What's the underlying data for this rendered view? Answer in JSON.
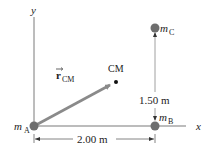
{
  "diagram": {
    "axes": {
      "x_label": "x",
      "y_label": "y"
    },
    "masses": [
      {
        "id": "A",
        "label": "m",
        "subscript": "A"
      },
      {
        "id": "B",
        "label": "m",
        "subscript": "B"
      },
      {
        "id": "C",
        "label": "m",
        "subscript": "C"
      }
    ],
    "center_of_mass": {
      "label": "CM"
    },
    "vector": {
      "label": "r",
      "subscript": "CM"
    },
    "dimensions": {
      "horizontal": "2.00 m",
      "vertical": "1.50 m"
    },
    "colors": {
      "mass": "#6e6e6e",
      "vector": "#8a8a8a",
      "axis": "#7a7a7a",
      "text": "#222222"
    }
  }
}
